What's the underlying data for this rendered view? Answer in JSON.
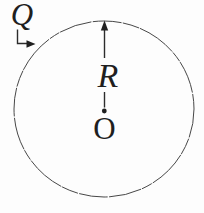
{
  "figure": {
    "labels": {
      "charge": "Q",
      "radius": "R",
      "center": "O"
    },
    "colors": {
      "ink": "#1f1f1f",
      "circle_stroke": "#474747",
      "background": "#fdfdfd"
    }
  }
}
